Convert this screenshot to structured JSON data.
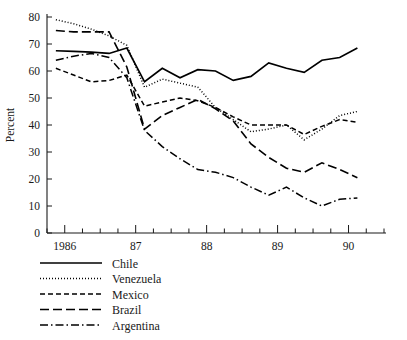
{
  "chart_data": {
    "type": "line",
    "title": "",
    "subtitle": "",
    "xlabel": "",
    "ylabel": "Percent",
    "ylim": [
      0,
      80
    ],
    "yticks": [
      0,
      10,
      20,
      30,
      40,
      50,
      60,
      70,
      80
    ],
    "ytick_labels": [
      "0",
      "10",
      "20",
      "30",
      "40",
      "50",
      "60",
      "70",
      "80"
    ],
    "xlim": [
      1985.75,
      1990.5
    ],
    "xticks": [
      1986,
      1987,
      1988,
      1989,
      1990
    ],
    "xtick_labels": [
      "1986",
      "87",
      "88",
      "89",
      "90"
    ],
    "minor_xticks_per_year": 4,
    "grid": false,
    "legend_position": "below-axes-left",
    "x": [
      1985.875,
      1986.125,
      1986.375,
      1986.625,
      1986.875,
      1987.125,
      1987.375,
      1987.625,
      1987.875,
      1988.125,
      1988.375,
      1988.625,
      1988.875,
      1989.125,
      1989.375,
      1989.625,
      1989.875,
      1990.125
    ],
    "x_quarter_labels": [
      "1985Q4",
      "1986Q1",
      "1986Q2",
      "1986Q3",
      "1986Q4",
      "1987Q1",
      "1987Q2",
      "1987Q3",
      "1987Q4",
      "1988Q1",
      "1988Q2",
      "1988Q3",
      "1988Q4",
      "1989Q1",
      "1989Q2",
      "1989Q3",
      "1989Q4",
      "1990Q1"
    ],
    "series": [
      {
        "name": "Chile",
        "style": "solid",
        "values": [
          67.5,
          67.3,
          67.0,
          66.5,
          68.5,
          56.0,
          61.0,
          57.5,
          60.5,
          60.0,
          56.5,
          58.0,
          63.0,
          61.0,
          59.5,
          64.0,
          65.0,
          68.5
        ]
      },
      {
        "name": "Venezuela",
        "style": "dotted",
        "values": [
          79.0,
          77.5,
          75.5,
          73.0,
          69.5,
          54.0,
          57.0,
          55.5,
          54.0,
          46.5,
          42.0,
          37.5,
          38.5,
          40.0,
          34.5,
          38.5,
          43.5,
          45.0
        ]
      },
      {
        "name": "Mexico",
        "style": "dashed",
        "values": [
          61.0,
          58.5,
          56.0,
          56.5,
          58.5,
          47.0,
          48.5,
          50.0,
          49.0,
          46.5,
          43.0,
          40.0,
          40.0,
          40.0,
          36.5,
          39.5,
          42.0,
          41.0
        ]
      },
      {
        "name": "Brazil",
        "style": "longdash",
        "values": [
          75.0,
          74.5,
          74.5,
          74.5,
          61.5,
          38.5,
          43.5,
          46.5,
          49.5,
          46.0,
          41.5,
          33.0,
          28.0,
          24.0,
          22.5,
          26.0,
          23.5,
          20.5
        ]
      },
      {
        "name": "Argentina",
        "style": "dashdot",
        "values": [
          64.0,
          65.5,
          66.5,
          65.0,
          57.5,
          38.0,
          32.0,
          27.5,
          23.5,
          22.5,
          20.5,
          17.0,
          14.0,
          17.0,
          13.0,
          10.0,
          12.5,
          13.0
        ]
      }
    ]
  },
  "legend": {
    "items": [
      {
        "label": "Chile",
        "style": "solid"
      },
      {
        "label": "Venezuela",
        "style": "dotted"
      },
      {
        "label": "Mexico",
        "style": "dashed"
      },
      {
        "label": "Brazil",
        "style": "longdash"
      },
      {
        "label": "Argentina",
        "style": "dashdot"
      }
    ]
  },
  "axis": {
    "y_title": "Percent"
  }
}
